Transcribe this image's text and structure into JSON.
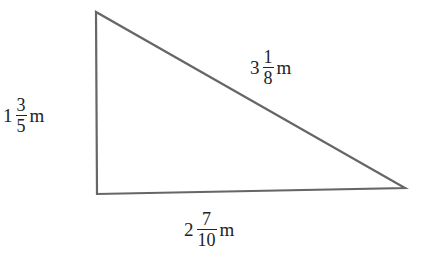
{
  "diagram": {
    "type": "right-triangle",
    "stroke_color": "#666666",
    "vertices": {
      "top": [
        96,
        12
      ],
      "bottom_left": [
        97,
        194
      ],
      "right": [
        405,
        188
      ]
    },
    "sides": {
      "left": {
        "whole": "1",
        "numerator": "3",
        "denominator": "5",
        "unit": "m"
      },
      "hypotenuse": {
        "whole": "3",
        "numerator": "1",
        "denominator": "8",
        "unit": "m"
      },
      "bottom": {
        "whole": "2",
        "numerator": "7",
        "denominator": "10",
        "unit": "m"
      }
    }
  }
}
